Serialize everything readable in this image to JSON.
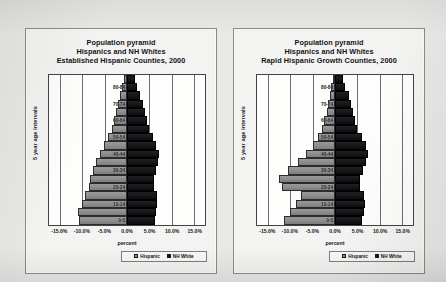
{
  "figure": {
    "background_color": "#e8e8e6",
    "panel_background": "#f3f3f1"
  },
  "colors": {
    "hispanic": "#8d8d8d",
    "nh_white": "#141417",
    "axis": "#43434a",
    "gridline": "#6d6d72"
  },
  "legend": {
    "items": [
      {
        "label": "Hispanic",
        "swatch": "hispanic"
      },
      {
        "label": "NH White",
        "swatch": "nh_white"
      }
    ]
  },
  "axis": {
    "ylabel": "5 year age intervals",
    "xlabel": "percent",
    "xticks": [
      "-15.0%",
      "-10.0%",
      "-5.0%",
      "0.0%",
      "5.0%",
      "10.0%",
      "15.0%"
    ],
    "xtick_values": [
      -15,
      -10,
      -5,
      0,
      5,
      10,
      15
    ],
    "xlim": [
      -17.5,
      17.5
    ],
    "age_labels": [
      "0-5",
      "10-14",
      "20-24",
      "30-34",
      "40-44",
      "50-54",
      "60-64",
      "70-74",
      "80-84"
    ]
  },
  "charts": [
    {
      "panel": "left",
      "title_lines": [
        "Population pyramid",
        "Hispanics and NH Whites",
        "Established Hispanic Counties, 2000"
      ]
    },
    {
      "panel": "right",
      "title_lines": [
        "Population pyramid",
        "Hispanics and NH Whites",
        "Rapid Hispanic Growth Counties, 2000"
      ]
    }
  ],
  "chart_data": [
    {
      "type": "bar",
      "subtype": "population-pyramid",
      "title": "Population pyramid Hispanics and NH Whites Established Hispanic Counties, 2000",
      "xlabel": "percent",
      "ylabel": "5 year age intervals",
      "xlim": [
        -17.5,
        17.5
      ],
      "grid": true,
      "legend_position": "bottom-right",
      "categories": [
        "0-5",
        "5-9",
        "10-14",
        "15-19",
        "20-24",
        "25-29",
        "30-34",
        "35-39",
        "40-44",
        "45-49",
        "50-54",
        "55-59",
        "60-64",
        "65-69",
        "70-74",
        "75-79",
        "80-84",
        "85+"
      ],
      "series": [
        {
          "name": "Hispanic",
          "side": "left",
          "values": [
            10.7,
            10.9,
            10.2,
            9.4,
            8.6,
            8.2,
            7.6,
            6.9,
            6.0,
            5.1,
            4.2,
            3.4,
            3.0,
            2.5,
            2.0,
            1.5,
            1.1,
            0.7
          ]
        },
        {
          "name": "NH White",
          "side": "right",
          "values": [
            6.3,
            6.6,
            6.8,
            6.8,
            6.1,
            6.0,
            6.4,
            7.0,
            7.2,
            6.6,
            5.8,
            4.9,
            4.4,
            4.0,
            3.6,
            3.0,
            2.2,
            1.8
          ]
        }
      ]
    },
    {
      "type": "bar",
      "subtype": "population-pyramid",
      "title": "Population pyramid Hispanics and NH Whites Rapid Hispanic Growth Counties, 2000",
      "xlabel": "percent",
      "ylabel": "5 year age intervals",
      "xlim": [
        -17.5,
        17.5
      ],
      "grid": true,
      "legend_position": "bottom-right",
      "categories": [
        "0-5",
        "5-9",
        "10-14",
        "15-19",
        "20-24",
        "25-29",
        "30-34",
        "35-39",
        "40-44",
        "45-49",
        "50-54",
        "55-59",
        "60-64",
        "65-69",
        "70-74",
        "75-79",
        "80-84",
        "85+"
      ],
      "series": [
        {
          "name": "Hispanic",
          "side": "left",
          "values": [
            11.4,
            10.2,
            8.8,
            7.6,
            12.0,
            12.6,
            10.6,
            8.4,
            6.5,
            5.0,
            3.8,
            2.9,
            2.4,
            1.9,
            1.5,
            1.1,
            0.8,
            0.5
          ]
        },
        {
          "name": "NH White",
          "side": "right",
          "values": [
            6.0,
            6.4,
            6.7,
            6.6,
            5.7,
            5.6,
            6.2,
            7.0,
            7.4,
            6.9,
            6.0,
            5.0,
            4.5,
            4.1,
            3.7,
            3.1,
            2.3,
            1.9
          ]
        }
      ]
    }
  ]
}
